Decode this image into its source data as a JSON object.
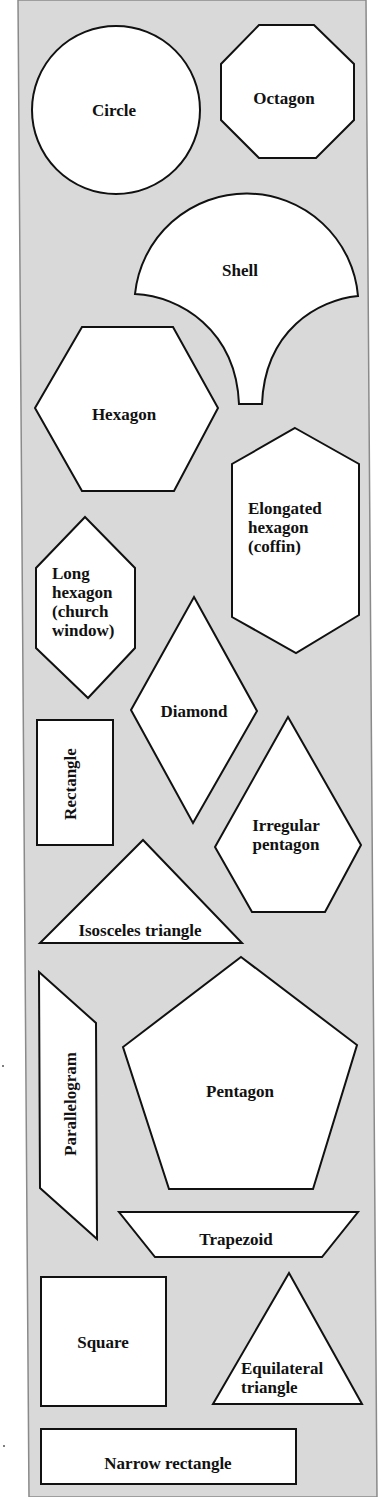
{
  "figure": {
    "background_color": "#ffffff",
    "panel_color": "#d9d9d9",
    "shape_fill": "#ffffff",
    "stroke_color": "#111111",
    "panel_outline": [
      [
        18,
        0
      ],
      [
        366,
        0
      ],
      [
        377,
        1497
      ],
      [
        29,
        1497
      ]
    ]
  },
  "shapes": [
    {
      "id": "circle",
      "name": "Circle",
      "kind": "circle",
      "cx": 116,
      "cy": 110,
      "r": 84,
      "lines": [
        "Circle"
      ],
      "label_x": 114,
      "label_y": 110,
      "rotate": 0
    },
    {
      "id": "octagon",
      "name": "Octagon",
      "kind": "polygon",
      "points": [
        [
          259,
          25
        ],
        [
          314,
          25
        ],
        [
          354,
          64
        ],
        [
          354,
          120
        ],
        [
          316,
          158
        ],
        [
          259,
          158
        ],
        [
          221,
          120
        ],
        [
          221,
          64
        ]
      ],
      "lines": [
        "Octagon"
      ],
      "label_x": 284,
      "label_y": 98,
      "rotate": 0
    },
    {
      "id": "shell",
      "name": "Shell",
      "kind": "path",
      "d": "M135,294 A112,112 0 0 1 358,296 C318,300 265,330 262,404 L239,404 C236,330 180,296 135,294 Z",
      "lines": [
        "Shell"
      ],
      "label_x": 240,
      "label_y": 270,
      "rotate": 0
    },
    {
      "id": "hexagon",
      "name": "Hexagon",
      "kind": "polygon",
      "points": [
        [
          35,
          408
        ],
        [
          82,
          327
        ],
        [
          173,
          327
        ],
        [
          218,
          408
        ],
        [
          174,
          491
        ],
        [
          82,
          491
        ]
      ],
      "lines": [
        "Hexagon"
      ],
      "label_x": 124,
      "label_y": 414,
      "rotate": 0
    },
    {
      "id": "elongated-hexagon",
      "name": "Elongated hexagon (coffin)",
      "kind": "polygon",
      "points": [
        [
          295,
          428
        ],
        [
          359,
          464
        ],
        [
          359,
          615
        ],
        [
          296,
          653
        ],
        [
          232,
          617
        ],
        [
          232,
          464
        ]
      ],
      "lines": [
        "Elongated",
        "hexagon",
        "(coffin)"
      ],
      "label_x": 248,
      "label_y": 514,
      "rotate": 0,
      "anchor": "start"
    },
    {
      "id": "long-hexagon",
      "name": "Long hexagon (church window)",
      "kind": "polygon",
      "points": [
        [
          85,
          517
        ],
        [
          135,
          568
        ],
        [
          135,
          648
        ],
        [
          88,
          698
        ],
        [
          36,
          648
        ],
        [
          36,
          568
        ]
      ],
      "lines": [
        "Long",
        "hexagon",
        "(church",
        "window)"
      ],
      "label_x": 52,
      "label_y": 579,
      "rotate": 0,
      "anchor": "start"
    },
    {
      "id": "diamond",
      "name": "Diamond",
      "kind": "polygon",
      "points": [
        [
          194,
          597
        ],
        [
          257,
          711
        ],
        [
          193,
          823
        ],
        [
          131,
          710
        ]
      ],
      "lines": [
        "Diamond"
      ],
      "label_x": 194,
      "label_y": 711,
      "rotate": 0
    },
    {
      "id": "rectangle",
      "name": "Rectangle",
      "kind": "polygon",
      "points": [
        [
          37,
          720
        ],
        [
          113,
          720
        ],
        [
          113,
          845
        ],
        [
          37,
          845
        ]
      ],
      "lines": [
        "Rectangle"
      ],
      "label_x": 70,
      "label_y": 784,
      "rotate": -90
    },
    {
      "id": "irregular-pentagon",
      "name": "Irregular pentagon",
      "kind": "polygon",
      "points": [
        [
          288,
          717
        ],
        [
          361,
          845
        ],
        [
          325,
          912
        ],
        [
          252,
          912
        ],
        [
          215,
          847
        ]
      ],
      "lines": [
        "Irregular",
        "pentagon"
      ],
      "label_x": 286,
      "label_y": 834,
      "rotate": 0
    },
    {
      "id": "isosceles-triangle",
      "name": "Isosceles triangle",
      "kind": "polygon",
      "points": [
        [
          143,
          840
        ],
        [
          242,
          943
        ],
        [
          40,
          943
        ]
      ],
      "lines": [
        "Isosceles triangle"
      ],
      "label_x": 140,
      "label_y": 930,
      "rotate": 0
    },
    {
      "id": "parallelogram",
      "name": "Parallelogram",
      "kind": "polygon",
      "points": [
        [
          39,
          972
        ],
        [
          96,
          1023
        ],
        [
          97,
          1239
        ],
        [
          40,
          1188
        ]
      ],
      "lines": [
        "Parallelogram"
      ],
      "label_x": 70,
      "label_y": 1104,
      "rotate": -90
    },
    {
      "id": "pentagon",
      "name": "Pentagon",
      "kind": "polygon",
      "points": [
        [
          241,
          957
        ],
        [
          357,
          1045
        ],
        [
          313,
          1189
        ],
        [
          169,
          1189
        ],
        [
          123,
          1047
        ]
      ],
      "lines": [
        "Pentagon"
      ],
      "label_x": 240,
      "label_y": 1091,
      "rotate": 0
    },
    {
      "id": "trapezoid",
      "name": "Trapezoid",
      "kind": "polygon",
      "points": [
        [
          119,
          1212
        ],
        [
          358,
          1212
        ],
        [
          322,
          1257
        ],
        [
          155,
          1257
        ]
      ],
      "lines": [
        "Trapezoid"
      ],
      "label_x": 236,
      "label_y": 1239,
      "rotate": 0
    },
    {
      "id": "square",
      "name": "Square",
      "kind": "polygon",
      "points": [
        [
          41,
          1277
        ],
        [
          166,
          1277
        ],
        [
          166,
          1406
        ],
        [
          41,
          1406
        ]
      ],
      "lines": [
        "Square"
      ],
      "label_x": 103,
      "label_y": 1342,
      "rotate": 0
    },
    {
      "id": "equilateral-triangle",
      "name": "Equilateral triangle",
      "kind": "polygon",
      "points": [
        [
          289,
          1273
        ],
        [
          362,
          1404
        ],
        [
          213,
          1404
        ]
      ],
      "lines": [
        "Equilateral",
        "triangle"
      ],
      "label_x": 241,
      "label_y": 1374,
      "rotate": 0,
      "anchor": "start"
    },
    {
      "id": "narrow-rectangle",
      "name": "Narrow rectangle",
      "kind": "polygon",
      "points": [
        [
          41,
          1429
        ],
        [
          296,
          1429
        ],
        [
          296,
          1484
        ],
        [
          41,
          1484
        ]
      ],
      "lines": [
        "Narrow rectangle"
      ],
      "label_x": 168,
      "label_y": 1463,
      "rotate": 0
    }
  ]
}
